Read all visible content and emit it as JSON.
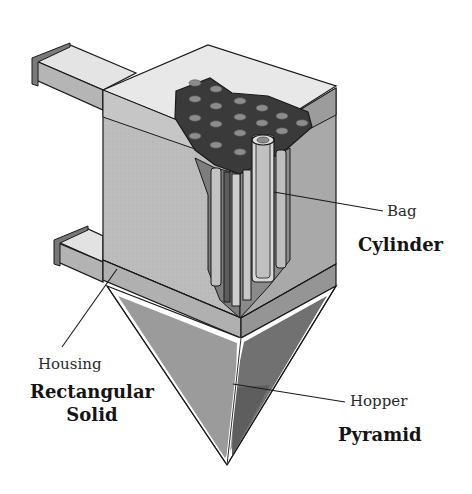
{
  "diagram": {
    "colors": {
      "outline": "#1a1a1a",
      "top_face": "#e6e6e6",
      "front_face": "#bdbdbd",
      "side_face": "#a6a6a6",
      "tube_sheet": "#3a3a3a",
      "tube_hole": "#8c8c8c",
      "hopper_left": "#9a9a9a",
      "hopper_right": "#6f6f6f",
      "bag": "#c8c8c8",
      "background": "#ffffff"
    },
    "labels": {
      "bag": "Bag",
      "cylinder": "Cylinder",
      "housing": "Housing",
      "rectangular_solid_line1": "Rectangular",
      "rectangular_solid_line2": "Solid",
      "hopper": "Hopper",
      "pyramid": "Pyramid"
    },
    "components": [
      {
        "name": "Bag",
        "shape": "Cylinder"
      },
      {
        "name": "Housing",
        "shape": "Rectangular Solid"
      },
      {
        "name": "Hopper",
        "shape": "Pyramid"
      }
    ]
  }
}
